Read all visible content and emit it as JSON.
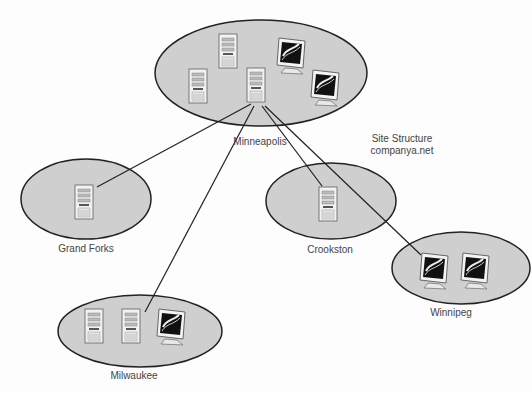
{
  "diagram": {
    "title_line1": "Site Structure",
    "title_line2": "companya.net",
    "colors": {
      "site_fill": "#cfcfcf",
      "site_stroke": "#222222",
      "link": "#222222",
      "text": "#444444"
    },
    "sites": [
      {
        "id": "minneapolis",
        "label": "Minneapolis",
        "devices": [
          "server",
          "server",
          "server",
          "monitor",
          "monitor"
        ]
      },
      {
        "id": "grand-forks",
        "label": "Grand Forks",
        "devices": [
          "server"
        ]
      },
      {
        "id": "crookston",
        "label": "Crookston",
        "devices": [
          "server"
        ]
      },
      {
        "id": "winnipeg",
        "label": "Winnipeg",
        "devices": [
          "monitor",
          "monitor"
        ]
      },
      {
        "id": "milwaukee",
        "label": "Milwaukee",
        "devices": [
          "server",
          "server",
          "monitor"
        ]
      }
    ],
    "links": [
      {
        "from": "Minneapolis",
        "to": "Grand Forks"
      },
      {
        "from": "Minneapolis",
        "to": "Milwaukee"
      },
      {
        "from": "Minneapolis",
        "to": "Crookston"
      },
      {
        "from": "Minneapolis",
        "to": "Winnipeg"
      }
    ]
  }
}
